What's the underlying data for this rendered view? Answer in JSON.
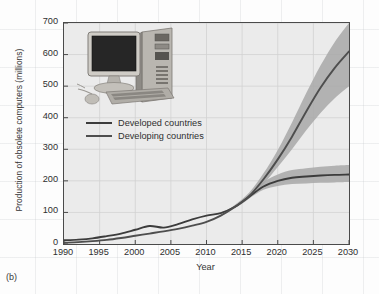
{
  "figure": {
    "caption": "(b)",
    "computer_icon": "desktop-computer-image"
  },
  "legend": {
    "position": "inside-upper-left",
    "items": [
      {
        "label": "Developed countries",
        "color": "#3c3c3c"
      },
      {
        "label": "Developing countries",
        "color": "#4e4e4e"
      }
    ]
  },
  "chart_data": {
    "type": "line",
    "title": "",
    "xlabel": "Year",
    "ylabel": "Production of obsolete computers (millions)",
    "xlim": [
      1990,
      2030
    ],
    "ylim": [
      0,
      700
    ],
    "xticks": [
      1990,
      1995,
      2000,
      2005,
      2010,
      2015,
      2020,
      2025,
      2030
    ],
    "yticks": [
      0,
      100,
      200,
      300,
      400,
      500,
      600,
      700
    ],
    "grid": true,
    "band_color": "#a8a8a8",
    "plot_background": "#ebebeb",
    "x": [
      1990,
      1992,
      1994,
      1996,
      1998,
      2000,
      2002,
      2004,
      2006,
      2008,
      2010,
      2012,
      2014,
      2016,
      2018,
      2020,
      2022,
      2024,
      2026,
      2028,
      2030
    ],
    "series": [
      {
        "name": "Developed countries",
        "color": "#3c3c3c",
        "values": [
          12,
          14,
          18,
          25,
          33,
          45,
          57,
          52,
          63,
          78,
          90,
          98,
          118,
          150,
          182,
          200,
          210,
          214,
          217,
          219,
          220
        ],
        "band_low": [
          12,
          14,
          18,
          25,
          33,
          45,
          57,
          52,
          63,
          78,
          90,
          98,
          116,
          145,
          172,
          184,
          190,
          192,
          194,
          195,
          196
        ],
        "band_high": [
          12,
          14,
          18,
          25,
          33,
          45,
          57,
          52,
          63,
          78,
          90,
          100,
          122,
          158,
          196,
          220,
          234,
          240,
          245,
          248,
          250
        ]
      },
      {
        "name": "Developing countries",
        "color": "#4e4e4e",
        "values": [
          4,
          6,
          9,
          13,
          19,
          26,
          33,
          40,
          48,
          58,
          70,
          90,
          118,
          152,
          205,
          268,
          340,
          420,
          495,
          558,
          610
        ],
        "band_low": [
          4,
          6,
          9,
          13,
          19,
          26,
          33,
          40,
          48,
          58,
          70,
          88,
          113,
          144,
          190,
          244,
          300,
          360,
          415,
          462,
          500
        ],
        "band_high": [
          4,
          6,
          9,
          13,
          19,
          26,
          33,
          40,
          48,
          58,
          70,
          92,
          124,
          163,
          224,
          298,
          385,
          478,
          565,
          640,
          700
        ]
      }
    ],
    "annotations": [
      {
        "text": "crossover of series",
        "x": 2017,
        "y": 190
      }
    ]
  }
}
